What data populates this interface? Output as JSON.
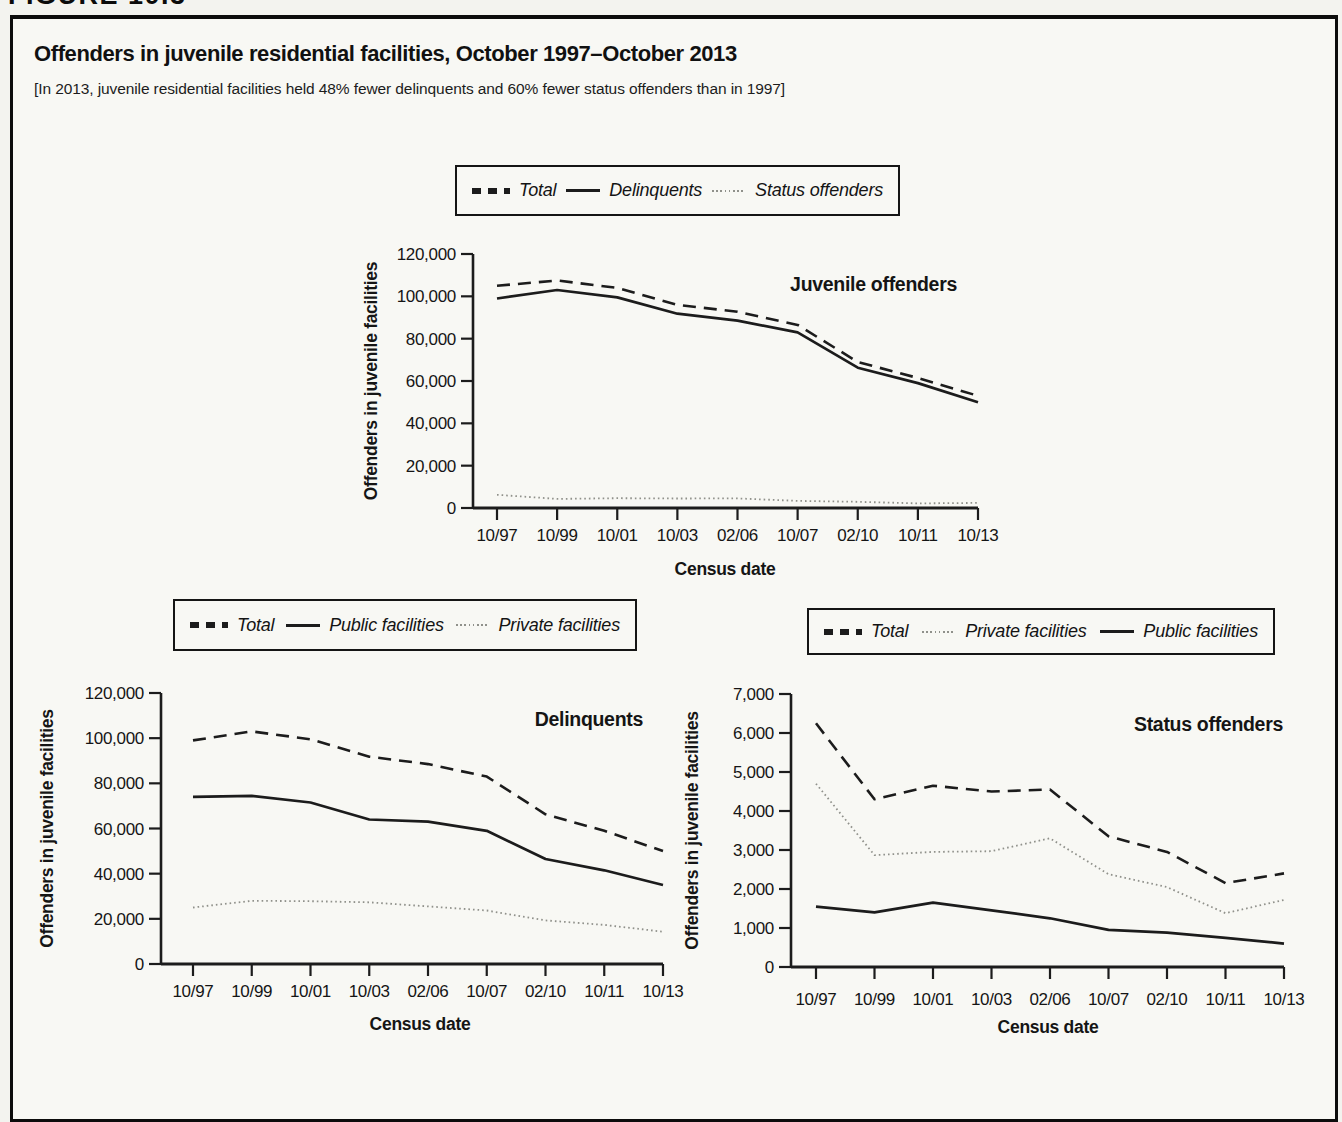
{
  "figure_label": "FIGURE 10.3",
  "title": "Offenders in juvenile residential facilities, October 1997–October 2013",
  "subtitle": "[In 2013, juvenile residential facilities held 48% fewer delinquents and 60% fewer status offenders than in 1997]",
  "colors": {
    "line_black": "#1c1c1c",
    "line_gray": "#90918b",
    "border_black": "#0c0c0c",
    "paper": "#f8f8f4"
  },
  "chart_data": [
    {
      "type": "line",
      "title": "Juvenile offenders",
      "xlabel": "Census date",
      "ylabel": "Offenders in juvenile facilities",
      "categories": [
        "10/97",
        "10/99",
        "10/01",
        "10/03",
        "02/06",
        "10/07",
        "02/10",
        "10/11",
        "10/13"
      ],
      "ylim": [
        0,
        120000
      ],
      "yticks": [
        0,
        20000,
        40000,
        60000,
        80000,
        100000,
        120000
      ],
      "ytick_labels": [
        "0",
        "20,000",
        "40,000",
        "60,000",
        "80,000",
        "100,000",
        "120,000"
      ],
      "grid": false,
      "legend_position": "top",
      "legend": [
        {
          "label": "Total",
          "style": "dashed"
        },
        {
          "label": "Delinquents",
          "style": "solid"
        },
        {
          "label": "Status offenders",
          "style": "dotted"
        }
      ],
      "series": [
        {
          "name": "Total",
          "style": "dashed",
          "values": [
            105000,
            107500,
            104000,
            96000,
            92700,
            86500,
            69000,
            61400,
            53000
          ]
        },
        {
          "name": "Delinquents",
          "style": "solid",
          "values": [
            99000,
            103000,
            99500,
            91800,
            88500,
            83000,
            66300,
            59000,
            50000
          ]
        },
        {
          "name": "Status offenders",
          "style": "dotted",
          "values": [
            6250,
            4300,
            4650,
            4500,
            4550,
            3350,
            2950,
            2150,
            2400
          ]
        }
      ]
    },
    {
      "type": "line",
      "title": "Delinquents",
      "xlabel": "Census date",
      "ylabel": "Offenders in juvenile facilities",
      "categories": [
        "10/97",
        "10/99",
        "10/01",
        "10/03",
        "02/06",
        "10/07",
        "02/10",
        "10/11",
        "10/13"
      ],
      "ylim": [
        0,
        120000
      ],
      "yticks": [
        0,
        20000,
        40000,
        60000,
        80000,
        100000,
        120000
      ],
      "ytick_labels": [
        "0",
        "20,000",
        "40,000",
        "60,000",
        "80,000",
        "100,000",
        "120,000"
      ],
      "grid": false,
      "legend_position": "top",
      "legend": [
        {
          "label": "Total",
          "style": "dashed"
        },
        {
          "label": "Public facilities",
          "style": "solid"
        },
        {
          "label": "Private facilities",
          "style": "dotted"
        }
      ],
      "series": [
        {
          "name": "Total",
          "style": "dashed",
          "values": [
            99000,
            103000,
            99500,
            91800,
            88500,
            83000,
            66300,
            59000,
            50000
          ]
        },
        {
          "name": "Public facilities",
          "style": "solid",
          "values": [
            74000,
            74500,
            71500,
            64000,
            63000,
            59000,
            46500,
            41500,
            35000
          ]
        },
        {
          "name": "Private facilities",
          "style": "dotted",
          "values": [
            25000,
            28000,
            27800,
            27300,
            25500,
            23700,
            19300,
            17300,
            14300
          ]
        }
      ]
    },
    {
      "type": "line",
      "title": "Status offenders",
      "xlabel": "Census date",
      "ylabel": "Offenders in juvenile facilities",
      "categories": [
        "10/97",
        "10/99",
        "10/01",
        "10/03",
        "02/06",
        "10/07",
        "02/10",
        "10/11",
        "10/13"
      ],
      "ylim": [
        0,
        7000
      ],
      "yticks": [
        0,
        1000,
        2000,
        3000,
        4000,
        5000,
        6000,
        7000
      ],
      "ytick_labels": [
        "0",
        "1,000",
        "2,000",
        "3,000",
        "4,000",
        "5,000",
        "6,000",
        "7,000"
      ],
      "grid": false,
      "legend_position": "top",
      "legend": [
        {
          "label": "Total",
          "style": "dashed"
        },
        {
          "label": "Private facilities",
          "style": "dotted"
        },
        {
          "label": "Public facilities",
          "style": "solid"
        }
      ],
      "series": [
        {
          "name": "Total",
          "style": "dashed",
          "values": [
            6250,
            4300,
            4650,
            4500,
            4550,
            3350,
            2950,
            2150,
            2400
          ]
        },
        {
          "name": "Private facilities",
          "style": "dotted",
          "values": [
            4700,
            2870,
            2950,
            2970,
            3300,
            2380,
            2050,
            1380,
            1720
          ]
        },
        {
          "name": "Public facilities",
          "style": "solid",
          "values": [
            1550,
            1400,
            1650,
            1450,
            1250,
            950,
            880,
            750,
            600
          ]
        }
      ]
    }
  ]
}
